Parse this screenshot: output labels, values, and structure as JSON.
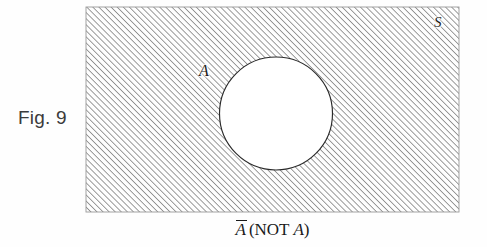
{
  "figure": {
    "number_label": "Fig. 9",
    "caption_complement_symbol": "A",
    "caption_open": "(NOT ",
    "caption_variable": "A",
    "caption_close": ")",
    "caption_full": "A̅ (NOT A)"
  },
  "labels": {
    "universal_set": "S",
    "set_a": "A"
  },
  "colors": {
    "background": "#ffffff",
    "hatch_line": "#555555",
    "outline": "#1a1a1a",
    "circle_fill": "#ffffff",
    "text": "#1a1a1a",
    "fig_label_text": "#3b3b3b"
  },
  "diagram_data": {
    "type": "venn",
    "description": "Shaded region represents the complement of set A within universal set S",
    "universe": {
      "shape": "rectangle",
      "label": "S",
      "x": 86,
      "y": 7,
      "width": 373,
      "height": 205,
      "fill": "hatched"
    },
    "sets": [
      {
        "name": "A",
        "shape": "circle",
        "label": "A",
        "cx": 276,
        "cy": 113.5,
        "r": 56.5,
        "fill": "white"
      }
    ],
    "shaded_region": "NOT A",
    "hatch": {
      "angle_degrees": 45,
      "direction": "lower-left to upper-right",
      "spacing_px": 4.3,
      "stroke_width_px": 1.0,
      "color": "#555555"
    }
  }
}
